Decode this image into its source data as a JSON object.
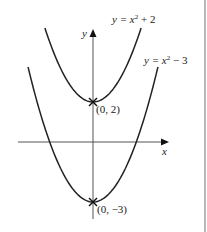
{
  "diagram": {
    "type": "function-graph",
    "axes": {
      "x_label": "x",
      "y_label": "y"
    },
    "curves": [
      {
        "equation": "y = x² + 2",
        "label_main": "y = x",
        "label_sup": "2",
        "label_tail": " + 2",
        "vertex": [
          0,
          2
        ],
        "vertex_label": "(0, 2)"
      },
      {
        "equation": "y = x² − 3",
        "label_main": "y = x",
        "label_sup": "2",
        "label_tail": " − 3",
        "vertex": [
          0,
          -3
        ],
        "vertex_label": "(0, −3)"
      }
    ],
    "colors": {
      "curve": "#222222",
      "axis": "#555555",
      "border": "#888888"
    }
  }
}
